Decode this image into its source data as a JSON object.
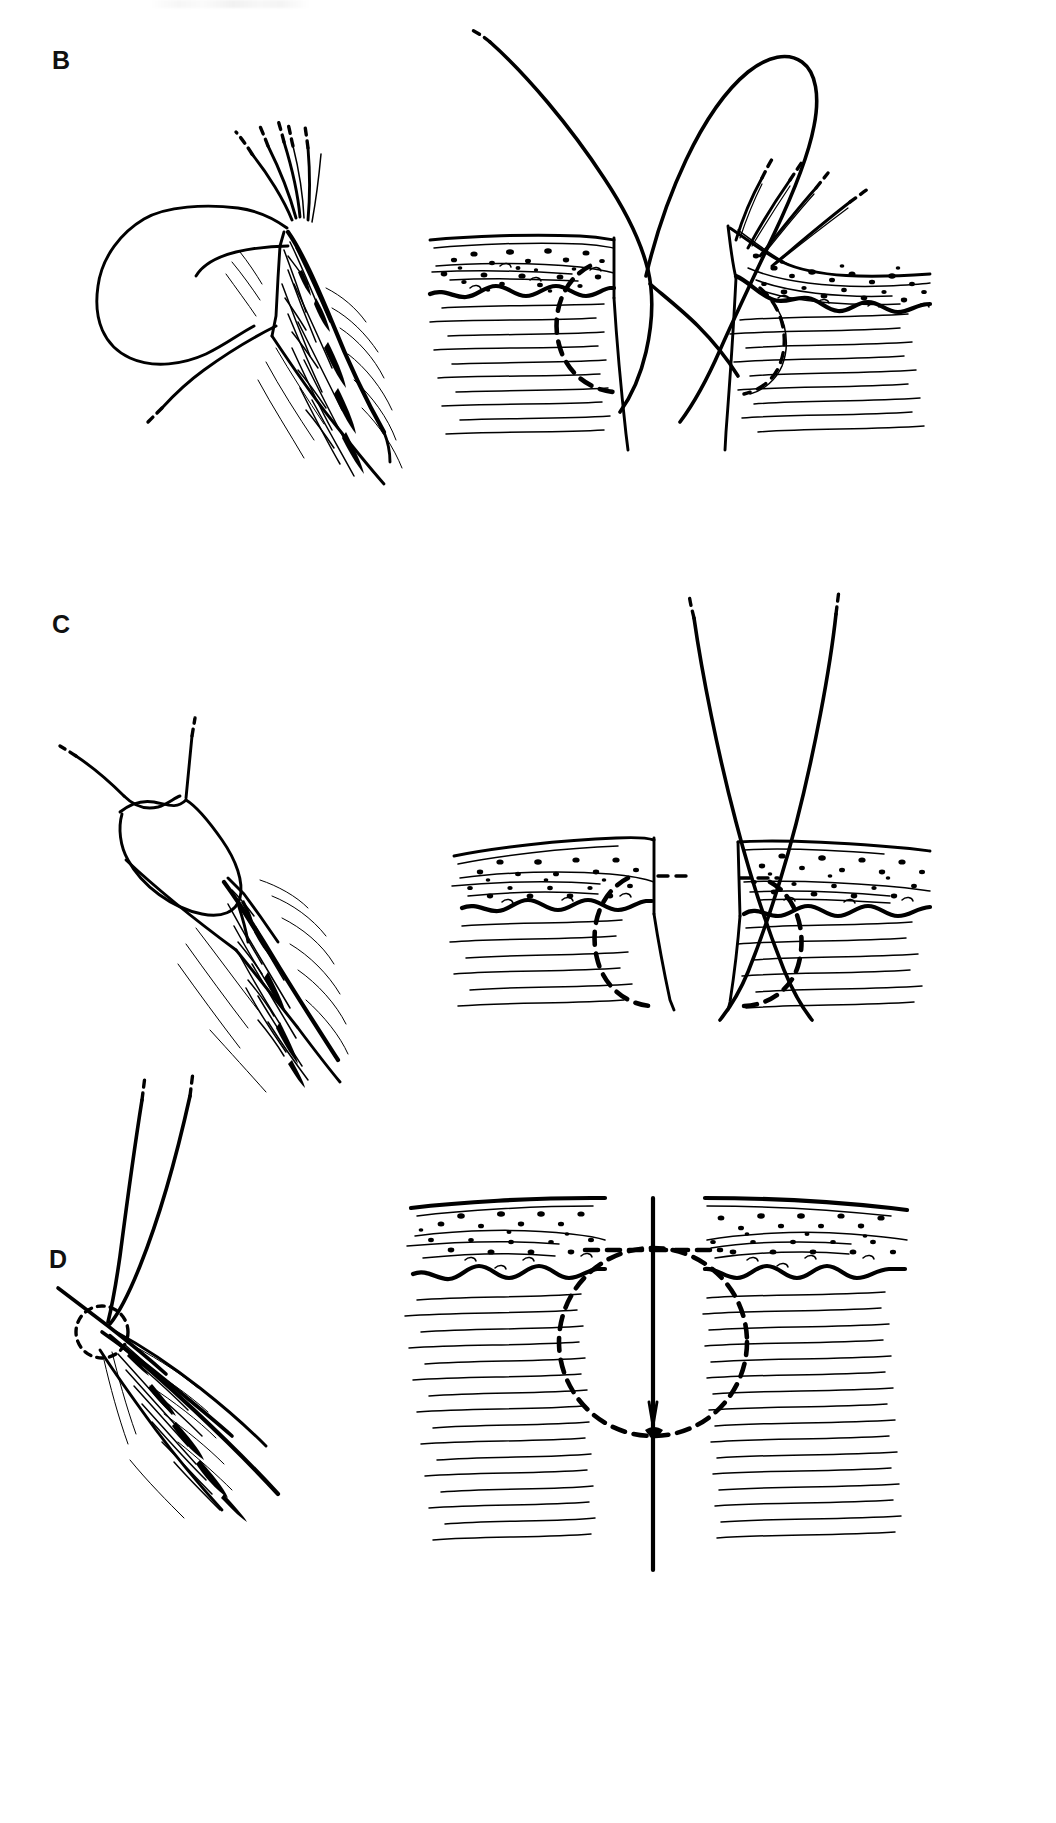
{
  "figure": {
    "background_color": "#ffffff",
    "ink_color": "#000000",
    "sheet_width": 1056,
    "sheet_height": 1823,
    "top_edge_artifact": "faint gray residue of a cropped caption line"
  },
  "panels": [
    {
      "id": "B",
      "label": "B",
      "label_x": 52,
      "label_y": 48,
      "row_caption": "Needle passed through dermis; loop of suture drawn up",
      "views": [
        {
          "id": "B-left",
          "name": "surgical-field-view",
          "orientation": "oblique",
          "contents": [
            "elongated diagonal wound with everted edges",
            "large suture loop held above the wound",
            "needle-holder jaws / multiple suture strands entering from upper right",
            "dashed free thread tail exiting lower left",
            "dense cross-hatched wound bed"
          ]
        },
        {
          "id": "B-right",
          "name": "cross-section-view",
          "orientation": "cross-section",
          "layers": [
            "epidermis",
            "stippled dermis",
            "wavy dermal-subcutaneous junction",
            "hatched subcutaneous fat"
          ],
          "contents": [
            "open wound gap at center",
            "heavy suture thread looping above skin surface",
            "dashed arc marking the intradermal needle path on each side",
            "hairs emerging from the right wound edge"
          ]
        }
      ]
    },
    {
      "id": "C",
      "label": "C",
      "label_x": 52,
      "label_y": 612,
      "row_caption": "Both suture limbs drawn up; loop reduced to a single crossing",
      "views": [
        {
          "id": "C-left",
          "name": "surgical-field-view",
          "orientation": "oblique",
          "contents": [
            "two dashed thread ends rising from a small crossed loop",
            "large open loop of suture narrowing into the wound",
            "elongated diagonal wound with cross-hatched bed"
          ]
        },
        {
          "id": "C-right",
          "name": "cross-section-view",
          "orientation": "cross-section",
          "layers": [
            "epidermis",
            "stippled dermis",
            "wavy dermal-subcutaneous junction",
            "hatched subcutaneous fat"
          ],
          "contents": [
            "deep V-shaped wound gap",
            "two suture limbs crossing at the wound base",
            "dashed arcs marking the buried needle path on each side",
            "dashed horizontal segment of thread inside the dermis"
          ]
        }
      ]
    },
    {
      "id": "D",
      "label": "D",
      "label_x": 49,
      "label_y": 1247,
      "row_caption": "Knot tied and buried; wound edges approximated",
      "views": [
        {
          "id": "D-left",
          "name": "surgical-field-view",
          "orientation": "oblique",
          "contents": [
            "two dashed suture limbs converging to a knot",
            "small dashed circle marking the buried knot",
            "closed wound line running to lower right"
          ]
        },
        {
          "id": "D-right",
          "name": "cross-section-view",
          "orientation": "cross-section",
          "layers": [
            "epidermis",
            "stippled dermis",
            "wavy dermal-subcutaneous junction",
            "hatched subcutaneous fat"
          ],
          "contents": [
            "wound fully approximated — single vertical closure line",
            "complete dashed circle showing the buried suture loop",
            "small knot at the bottom of the loop",
            "dashed horizontal thread segment within the dermis"
          ]
        }
      ]
    }
  ]
}
